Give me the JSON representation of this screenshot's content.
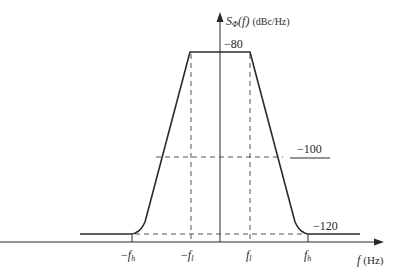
{
  "diagram": {
    "type": "phase-noise-spectrum",
    "y_axis": {
      "symbol": "S",
      "subscript": "Φ",
      "arg": "(f)",
      "unit": "(dBc/Hz)"
    },
    "x_axis": {
      "symbol": "f",
      "unit": "(Hz)"
    },
    "levels": [
      {
        "label": "−80",
        "value": -80
      },
      {
        "label": "−100",
        "value": -100
      },
      {
        "label": "−120",
        "value": -120
      }
    ],
    "x_ticks": [
      {
        "prefix": "−",
        "sym": "f",
        "sub": "h"
      },
      {
        "prefix": "−",
        "sym": "f",
        "sub": "l"
      },
      {
        "prefix": "",
        "sym": "f",
        "sub": "l"
      },
      {
        "prefix": "",
        "sym": "f",
        "sub": "h"
      }
    ],
    "colors": {
      "curve": "#2a2a2a",
      "dashed": "#555555",
      "axis": "#2a2a2a"
    }
  }
}
